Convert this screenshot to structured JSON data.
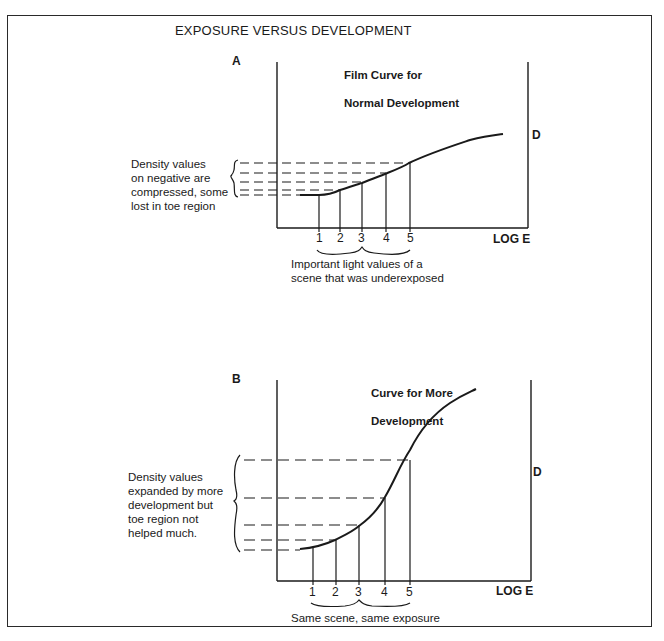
{
  "title": "EXPOSURE VERSUS DEVELOPMENT",
  "panels": [
    {
      "label": "A",
      "curve_title_line1": "Film Curve for",
      "curve_title_line2": "Normal Development",
      "left_note": "Density values\non negative are\ncompressed, some\nlost in toe region",
      "bottom_note": "Important light values of a\nscene that was underexposed",
      "x_axis_label": "LOG E",
      "y_axis_label": "D",
      "tick_labels": [
        "1",
        "2",
        "3",
        "4",
        "5"
      ]
    },
    {
      "label": "B",
      "curve_title_line1": "Curve for More",
      "curve_title_line2": "Development",
      "left_note": "Density values\nexpanded by more\ndevelopment but\ntoe region not\nhelped much.",
      "bottom_note": "Same scene, same exposure",
      "x_axis_label": "LOG E",
      "y_axis_label": "D",
      "tick_labels": [
        "1",
        "2",
        "3",
        "4",
        "5"
      ]
    }
  ],
  "colors": {
    "ink": "#1a1a1a",
    "background": "#ffffff"
  }
}
